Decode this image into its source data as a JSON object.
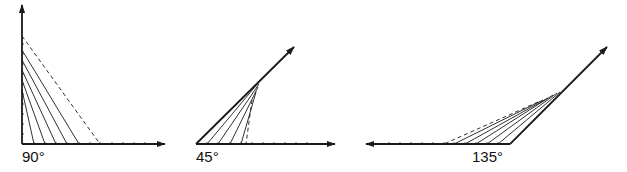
{
  "figures": [
    {
      "id": "angle-90",
      "label": "90°",
      "vertex": [
        22,
        144
      ],
      "ray_a_tip": [
        22,
        5
      ],
      "ray_b_tip": [
        165,
        144
      ],
      "solid_lines": [
        [
          [
            22,
            90
          ],
          [
            34,
            144
          ]
        ],
        [
          [
            22,
            80
          ],
          [
            45,
            144
          ]
        ],
        [
          [
            22,
            70
          ],
          [
            56,
            144
          ]
        ],
        [
          [
            22,
            60
          ],
          [
            67,
            144
          ]
        ],
        [
          [
            22,
            50
          ],
          [
            79,
            144
          ]
        ]
      ],
      "dashed_lines": [
        [
          [
            22,
            36
          ],
          [
            100,
            144
          ]
        ]
      ],
      "ticks_axis_a": [
        134,
        124,
        114,
        104,
        94,
        84,
        74,
        64,
        54,
        44
      ],
      "ticks_axis_b": [
        34,
        45,
        56,
        67,
        79,
        90,
        100,
        112,
        123,
        134,
        145
      ],
      "label_pos": [
        22,
        148
      ]
    },
    {
      "id": "angle-45",
      "label": "45°",
      "vertex": [
        196,
        144
      ],
      "ray_a_tip": [
        294,
        47
      ],
      "ray_b_tip": [
        335,
        144
      ],
      "solid_lines": [
        [
          [
            259,
            82
          ],
          [
            207,
            144
          ]
        ],
        [
          [
            259,
            84
          ],
          [
            218,
            144
          ]
        ],
        [
          [
            258,
            87
          ],
          [
            230,
            144
          ]
        ],
        [
          [
            256,
            92
          ],
          [
            241,
            144
          ]
        ]
      ],
      "dashed_lines": [
        [
          [
            252,
            100
          ],
          [
            246,
            144
          ]
        ]
      ],
      "ticks_axis_b": [
        207,
        218,
        230,
        241,
        252,
        263,
        274,
        285,
        296,
        307
      ],
      "label_pos": [
        196,
        148
      ]
    },
    {
      "id": "angle-135",
      "label": "135°",
      "vertex": [
        510,
        144
      ],
      "ray_a_tip": [
        366,
        144
      ],
      "ray_b_tip": [
        607,
        47
      ],
      "solid_lines": [
        [
          [
            560,
            92
          ],
          [
            498,
            144
          ]
        ],
        [
          [
            557,
            93
          ],
          [
            487,
            144
          ]
        ],
        [
          [
            553,
            95
          ],
          [
            476,
            144
          ]
        ],
        [
          [
            548,
            98
          ],
          [
            465,
            144
          ]
        ],
        [
          [
            543,
            100
          ],
          [
            454,
            144
          ]
        ]
      ],
      "dashed_lines": [
        [
          [
            538,
            102
          ],
          [
            444,
            144
          ]
        ]
      ],
      "ticks_axis_a": [
        498,
        487,
        476,
        465,
        454,
        444,
        433,
        422,
        411,
        400,
        389
      ],
      "label_pos": [
        472,
        148
      ]
    }
  ],
  "style": {
    "stroke": "#1a1a1a",
    "background": "#ffffff"
  }
}
